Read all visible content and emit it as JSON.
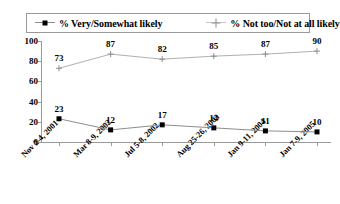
{
  "chart_data": {
    "type": "line",
    "title": "",
    "subtitle": "",
    "xlabel": "",
    "ylabel": "",
    "ylim": [
      0,
      100
    ],
    "yticks": [
      0,
      20,
      40,
      60,
      80,
      100
    ],
    "grid": false,
    "legend_position": "top",
    "categories": [
      "Nov 2-4, 2001",
      "Mar 8-9, 2002",
      "Jul 5-8, 2002",
      "Aug 25-26, 2003",
      "Jan 9-11, 2004",
      "Jan 7-9, 2005"
    ],
    "series": [
      {
        "name": "% Very/Somewhat likely",
        "marker": "square",
        "color": "#000000",
        "line_color": "#8d8d8d",
        "values": [
          23,
          12,
          17,
          14,
          11,
          10
        ]
      },
      {
        "name": "% Not too/Not at all likely",
        "marker": "plus",
        "color": "#8d8d8d",
        "line_color": "#b0b0b0",
        "values": [
          73,
          87,
          82,
          85,
          87,
          90
        ]
      }
    ]
  },
  "legend": {
    "entries": [
      {
        "label": "% Very/Somewhat likely",
        "marker": "square-marker"
      },
      {
        "label": "% Not too/Not at all likely",
        "marker": "plus-marker"
      }
    ]
  },
  "yaxis": {
    "labels": [
      "100",
      "80",
      "60",
      "40",
      "20",
      "0"
    ]
  },
  "xaxis": {
    "labels": [
      "Nov 2-4, 2001",
      "Mar 8-9, 2002",
      "Jul 5-8, 2002",
      "Aug 25-26, 2003",
      "Jan 9-11, 2004",
      "Jan 7-9, 2005"
    ]
  },
  "colors": {
    "series1": "#000000",
    "series2": "#8d8d8d",
    "axis": "#9a9a9a",
    "background": "#ffffff"
  }
}
